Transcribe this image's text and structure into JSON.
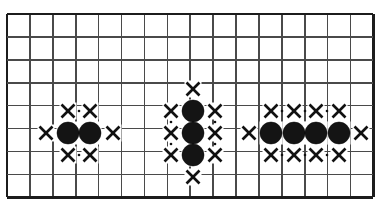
{
  "figure": {
    "width": 381,
    "height": 209,
    "background_color": "#ffffff"
  },
  "board": {
    "name": "go-board-grid",
    "line_color": "#4a4a4a",
    "border_color": "#1c1c1c",
    "cell_size": 22.9,
    "origin_x": 7,
    "origin_y": 14,
    "columns": 17,
    "rows": 9,
    "vertical_line_x": [
      7,
      29.9,
      52.8,
      75.7,
      98.6,
      121.5,
      144.4,
      167.3,
      190.2,
      213.1,
      236,
      258.9,
      281.8,
      304.7,
      327.6,
      350.5,
      373.4
    ],
    "horizontal_line_y": [
      14,
      36.9,
      59.8,
      82.7,
      105.6,
      128.5,
      151.4,
      174.3,
      197.2
    ]
  },
  "groups": [
    {
      "name": "left-group",
      "label": "two-stone horizontal group",
      "stone_count": 2,
      "liberty_count": 6,
      "stone_color": "#141414",
      "stones": [
        {
          "cx": 68,
          "cy": 133
        },
        {
          "cx": 90,
          "cy": 133
        }
      ],
      "liberties": [
        {
          "cx": 46,
          "cy": 133
        },
        {
          "cx": 113,
          "cy": 133
        },
        {
          "cx": 68,
          "cy": 111
        },
        {
          "cx": 90,
          "cy": 111
        },
        {
          "cx": 68,
          "cy": 155
        },
        {
          "cx": 90,
          "cy": 155
        }
      ],
      "dots": [
        {
          "cx": 79,
          "cy": 111
        },
        {
          "cx": 79,
          "cy": 155
        }
      ]
    },
    {
      "name": "middle-group",
      "label": "three-stone vertical group",
      "stone_count": 3,
      "liberty_count": 8,
      "stone_color": "#141414",
      "stones": [
        {
          "cx": 193,
          "cy": 111
        },
        {
          "cx": 193,
          "cy": 133
        },
        {
          "cx": 193,
          "cy": 155
        }
      ],
      "liberties": [
        {
          "cx": 193,
          "cy": 89
        },
        {
          "cx": 193,
          "cy": 177
        },
        {
          "cx": 171,
          "cy": 111
        },
        {
          "cx": 171,
          "cy": 133
        },
        {
          "cx": 171,
          "cy": 155
        },
        {
          "cx": 215,
          "cy": 111
        },
        {
          "cx": 215,
          "cy": 133
        },
        {
          "cx": 215,
          "cy": 155
        }
      ],
      "dots": [
        {
          "cx": 171,
          "cy": 122
        },
        {
          "cx": 171,
          "cy": 144
        },
        {
          "cx": 215,
          "cy": 122
        },
        {
          "cx": 215,
          "cy": 144
        }
      ]
    },
    {
      "name": "right-group",
      "label": "four-stone horizontal group",
      "stone_count": 4,
      "liberty_count": 10,
      "stone_color": "#141414",
      "stones": [
        {
          "cx": 271,
          "cy": 133
        },
        {
          "cx": 294,
          "cy": 133
        },
        {
          "cx": 316,
          "cy": 133
        },
        {
          "cx": 339,
          "cy": 133
        }
      ],
      "liberties": [
        {
          "cx": 249,
          "cy": 133
        },
        {
          "cx": 361,
          "cy": 133
        },
        {
          "cx": 271,
          "cy": 111
        },
        {
          "cx": 294,
          "cy": 111
        },
        {
          "cx": 316,
          "cy": 111
        },
        {
          "cx": 339,
          "cy": 111
        },
        {
          "cx": 271,
          "cy": 155
        },
        {
          "cx": 294,
          "cy": 155
        },
        {
          "cx": 316,
          "cy": 155
        },
        {
          "cx": 339,
          "cy": 155
        }
      ],
      "dots": [
        {
          "cx": 282,
          "cy": 111
        },
        {
          "cx": 305,
          "cy": 111
        },
        {
          "cx": 327,
          "cy": 111
        },
        {
          "cx": 282,
          "cy": 155
        },
        {
          "cx": 305,
          "cy": 155
        },
        {
          "cx": 327,
          "cy": 155
        }
      ]
    }
  ],
  "marks": {
    "stone_radius": 11,
    "x_arm": 6.5,
    "dot_radius": 1.3,
    "mask_pad": 8.5
  }
}
